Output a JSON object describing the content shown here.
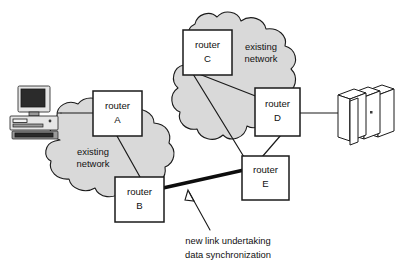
{
  "diagram": {
    "colors": {
      "cloud_fill": "#d9d9d9",
      "outline": "#1a1a1a",
      "node_fill": "#ffffff",
      "new_link": "#0d0d0d",
      "background": "#ffffff"
    },
    "clouds": [
      {
        "id": "left-cloud",
        "label_line1": "existing",
        "label_line2": "network"
      },
      {
        "id": "right-cloud",
        "label_line1": "existing",
        "label_line2": "network"
      }
    ],
    "nodes": [
      {
        "id": "router-a",
        "label_line1": "router",
        "label_line2": "A"
      },
      {
        "id": "router-b",
        "label_line1": "router",
        "label_line2": "B"
      },
      {
        "id": "router-c",
        "label_line1": "router",
        "label_line2": "C"
      },
      {
        "id": "router-d",
        "label_line1": "router",
        "label_line2": "D"
      },
      {
        "id": "router-e",
        "label_line1": "router",
        "label_line2": "E"
      }
    ],
    "devices": [
      {
        "id": "workstation",
        "kind": "desktop-computer-icon"
      },
      {
        "id": "mainframe",
        "kind": "server-rack-icon"
      }
    ],
    "links": [
      {
        "id": "link-workstation-a",
        "from": "workstation",
        "to": "router-a",
        "style": "thin"
      },
      {
        "id": "link-a-b",
        "from": "router-a",
        "to": "router-b",
        "style": "thin"
      },
      {
        "id": "link-c-d",
        "from": "router-c",
        "to": "router-d",
        "style": "thin"
      },
      {
        "id": "link-c-e",
        "from": "router-c",
        "to": "router-e",
        "style": "thin"
      },
      {
        "id": "link-d-e",
        "from": "router-d",
        "to": "router-e",
        "style": "thin"
      },
      {
        "id": "link-d-mainframe",
        "from": "router-d",
        "to": "mainframe",
        "style": "thin"
      },
      {
        "id": "link-b-e-new",
        "from": "router-b",
        "to": "router-e",
        "style": "thick"
      }
    ],
    "annotation": {
      "id": "new-link-annotation",
      "line1": "new link undertaking",
      "line2": "data synchronization",
      "points_to": "link-b-e-new"
    }
  }
}
